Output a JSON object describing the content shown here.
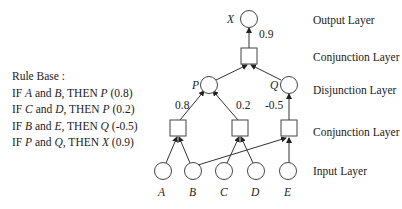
{
  "rule_base": {
    "title": "Rule Base :",
    "rules": [
      {
        "prefix": "IF ",
        "a": "A",
        "mid": " and ",
        "b": "B",
        "then": ", THEN ",
        "c": "P",
        "w": " (0.8)"
      },
      {
        "prefix": "IF ",
        "a": "C",
        "mid": " and ",
        "b": "D",
        "then": ", THEN ",
        "c": "P",
        "w": " (0.2)"
      },
      {
        "prefix": "IF ",
        "a": "B",
        "mid": " and ",
        "b": "E",
        "then": ", THEN ",
        "c": "Q",
        "w": " (-0.5)"
      },
      {
        "prefix": "IF ",
        "a": "P",
        "mid": " and ",
        "b": "Q",
        "then": ", THEN ",
        "c": "X",
        "w": " (0.9)"
      }
    ]
  },
  "layers": {
    "output": "Output Layer",
    "conj_top": "Conjunction Layer",
    "disjunction": "Disjunction Layer",
    "conj_bottom": "Conjunction Layer",
    "input": "Input Layer"
  },
  "nodes": {
    "inputs": [
      "A",
      "B",
      "C",
      "D",
      "E"
    ],
    "disjunction": [
      "P",
      "Q"
    ],
    "output": "X"
  },
  "weights": {
    "ab_to_p": "0.8",
    "cd_to_p": "0.2",
    "be_to_q": "-0.5",
    "pq_to_x": "0.9"
  }
}
